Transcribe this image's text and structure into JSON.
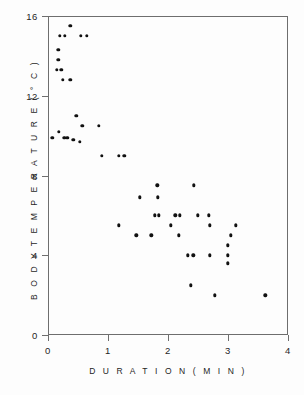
{
  "chart_data": {
    "type": "scatter",
    "title": "",
    "xlabel": "D U R A T I O N   ( M I N )",
    "ylabel": "B O D Y   T E M P E R A T U R E   ( ° C )",
    "xlabel_plain": "DURATION (MIN)",
    "ylabel_plain": "BODY TEMPERATURE (°C)",
    "xlim": [
      0,
      4
    ],
    "ylim": [
      0,
      16
    ],
    "xticks": [
      0,
      1,
      2,
      3,
      4
    ],
    "yticks": [
      0,
      4,
      8,
      12,
      16
    ],
    "xtick_labels": [
      "0",
      "1",
      "2",
      "3",
      "4"
    ],
    "ytick_labels": [
      "0",
      "4",
      "8",
      "12",
      "16"
    ],
    "grid": false,
    "legend": false,
    "marker": "filled-circle",
    "marker_color": "#111111",
    "axis_color": "#6e6e6e",
    "background": "#ffffff",
    "n_points": 58,
    "points": [
      {
        "x": 0.37,
        "y": 15.5
      },
      {
        "x": 0.2,
        "y": 15.0
      },
      {
        "x": 0.28,
        "y": 15.0
      },
      {
        "x": 0.55,
        "y": 15.0
      },
      {
        "x": 0.65,
        "y": 15.0
      },
      {
        "x": 0.17,
        "y": 14.3
      },
      {
        "x": 0.17,
        "y": 13.8
      },
      {
        "x": 0.15,
        "y": 13.3
      },
      {
        "x": 0.22,
        "y": 13.3
      },
      {
        "x": 0.25,
        "y": 12.8
      },
      {
        "x": 0.37,
        "y": 12.8
      },
      {
        "x": 0.47,
        "y": 11.0
      },
      {
        "x": 0.57,
        "y": 10.5
      },
      {
        "x": 0.85,
        "y": 10.5
      },
      {
        "x": 0.18,
        "y": 10.2
      },
      {
        "x": 0.07,
        "y": 9.9
      },
      {
        "x": 0.27,
        "y": 9.9
      },
      {
        "x": 0.32,
        "y": 9.9
      },
      {
        "x": 0.42,
        "y": 9.8
      },
      {
        "x": 0.53,
        "y": 9.7
      },
      {
        "x": 0.9,
        "y": 9.0
      },
      {
        "x": 1.18,
        "y": 9.0
      },
      {
        "x": 1.27,
        "y": 9.0
      },
      {
        "x": 1.82,
        "y": 7.5
      },
      {
        "x": 2.43,
        "y": 7.5
      },
      {
        "x": 1.53,
        "y": 6.9
      },
      {
        "x": 1.83,
        "y": 6.9
      },
      {
        "x": 1.78,
        "y": 6.0
      },
      {
        "x": 1.85,
        "y": 6.0
      },
      {
        "x": 2.12,
        "y": 6.0
      },
      {
        "x": 2.2,
        "y": 6.0
      },
      {
        "x": 2.5,
        "y": 6.0
      },
      {
        "x": 2.68,
        "y": 6.0
      },
      {
        "x": 1.18,
        "y": 5.5
      },
      {
        "x": 2.05,
        "y": 5.5
      },
      {
        "x": 2.7,
        "y": 5.5
      },
      {
        "x": 3.13,
        "y": 5.5
      },
      {
        "x": 1.47,
        "y": 5.0
      },
      {
        "x": 1.72,
        "y": 5.0
      },
      {
        "x": 2.18,
        "y": 5.0
      },
      {
        "x": 3.05,
        "y": 5.0
      },
      {
        "x": 3.0,
        "y": 4.5
      },
      {
        "x": 2.33,
        "y": 4.0
      },
      {
        "x": 2.42,
        "y": 4.0
      },
      {
        "x": 2.7,
        "y": 4.0
      },
      {
        "x": 3.0,
        "y": 4.0
      },
      {
        "x": 3.0,
        "y": 3.6
      },
      {
        "x": 2.38,
        "y": 2.5
      },
      {
        "x": 2.78,
        "y": 2.0
      },
      {
        "x": 3.62,
        "y": 2.0
      }
    ]
  },
  "figure": {
    "caption": "",
    "axes_name": "scatter-axes"
  }
}
